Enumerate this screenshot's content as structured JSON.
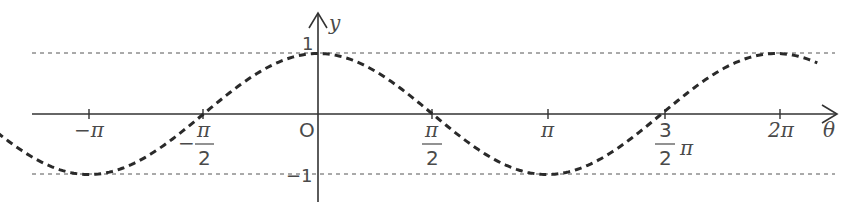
{
  "chart_data": {
    "type": "line",
    "title": "",
    "function": "y = cos(theta)",
    "xlabel": "θ",
    "ylabel": "y",
    "origin_label": "O",
    "x_range": [
      -4.4,
      6.85
    ],
    "ylim": [
      -1,
      1
    ],
    "x_ticks": [
      {
        "value": -3.14159,
        "label": "−π"
      },
      {
        "value": -1.5708,
        "label": "−π/2"
      },
      {
        "value": 1.5708,
        "label": "π/2"
      },
      {
        "value": 3.14159,
        "label": "π"
      },
      {
        "value": 4.71239,
        "label": "3/2 π"
      },
      {
        "value": 6.28319,
        "label": "2π"
      }
    ],
    "y_ticks": [
      {
        "value": 1,
        "label": "1"
      },
      {
        "value": -1,
        "label": "−1"
      }
    ],
    "reference_lines": [
      {
        "y": 1,
        "style": "dashed"
      },
      {
        "y": -1,
        "style": "dashed"
      }
    ],
    "series": [
      {
        "name": "cos θ",
        "style": "dashed-thick",
        "x": [
          -4.4,
          -3.14159,
          -1.5708,
          0,
          1.5708,
          3.14159,
          4.71239,
          6.28319,
          6.85
        ],
        "y": [
          -0.31,
          -1,
          0,
          1,
          0,
          -1,
          0,
          1,
          0.84
        ]
      }
    ],
    "grid": false,
    "legend": "none"
  },
  "labels": {
    "y_axis": "y",
    "x_axis": "θ",
    "origin": "O",
    "y_one": "1",
    "y_neg_one": "−1",
    "neg_pi": "−π",
    "neg_half_pi_minus": "−",
    "pi": "π",
    "two": "2",
    "three": "3",
    "two_pi": "2π"
  }
}
